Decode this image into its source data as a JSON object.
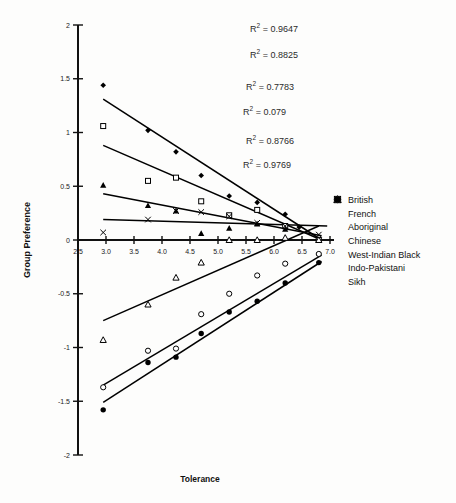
{
  "chart_data": {
    "type": "scatter",
    "title": "",
    "xlabel": "Tolerance",
    "ylabel": "Group Preference",
    "xlim": [
      2.5,
      7.0
    ],
    "ylim": [
      -2,
      2
    ],
    "grid": false,
    "xticks": [
      "2.5",
      "3.0",
      "3.5",
      "4.0",
      "4.5",
      "5.0",
      "5.5",
      "6.0",
      "6.5",
      "7.0"
    ],
    "yticks": [
      "2",
      "1.5",
      "1",
      "0.5",
      "0",
      "-0.5",
      "-1",
      "-1.5",
      "-2"
    ],
    "legend_position": "right",
    "annotations": [
      {
        "text": "R² = 0.9647",
        "value": 0.9647
      },
      {
        "text": "R² = 0.8825",
        "value": 0.8825
      },
      {
        "text": "R² = 0.7783",
        "value": 0.7783
      },
      {
        "text": "R² = 0.079",
        "value": 0.079
      },
      {
        "text": "R² = 0.8766",
        "value": 0.8766
      },
      {
        "text": "R² = 0.9769",
        "value": 0.9769
      }
    ],
    "series": [
      {
        "name": "British",
        "marker": "filled-diamond",
        "x": [
          2.95,
          3.75,
          4.25,
          4.7,
          5.2,
          5.7,
          6.2,
          6.45,
          6.8
        ],
        "y": [
          1.44,
          1.02,
          0.82,
          0.6,
          0.41,
          0.35,
          0.24,
          0.12,
          0.0
        ],
        "fit": {
          "x0": 2.95,
          "y0": 1.31,
          "x1": 6.85,
          "y1": 0.0
        }
      },
      {
        "name": "French",
        "marker": "open-square",
        "x": [
          2.95,
          3.75,
          4.25,
          4.7,
          5.2,
          5.7,
          6.2,
          6.8
        ],
        "y": [
          1.06,
          0.55,
          0.58,
          0.36,
          0.23,
          0.28,
          0.13,
          0.0
        ],
        "fit": {
          "x0": 2.95,
          "y0": 0.88,
          "x1": 6.85,
          "y1": 0.0
        }
      },
      {
        "name": "Aboriginal",
        "marker": "filled-triangle",
        "x": [
          2.95,
          3.75,
          4.25,
          4.7,
          5.2,
          5.7,
          6.2,
          6.8
        ],
        "y": [
          0.51,
          0.32,
          0.27,
          0.06,
          0.11,
          0.15,
          0.1,
          0.0
        ],
        "fit": {
          "x0": 2.95,
          "y0": 0.43,
          "x1": 6.85,
          "y1": 0.04
        }
      },
      {
        "name": "Chinese",
        "marker": "x-cross",
        "x": [
          2.95,
          3.75,
          4.25,
          4.7,
          5.2,
          5.7,
          6.2,
          6.8
        ],
        "y": [
          0.07,
          0.19,
          0.27,
          0.26,
          0.22,
          0.16,
          0.13,
          0.05
        ],
        "fit": {
          "x0": 2.95,
          "y0": 0.19,
          "x1": 6.95,
          "y1": 0.13
        }
      },
      {
        "name": "West-Indian Black",
        "marker": "open-triangle",
        "x": [
          2.95,
          3.75,
          4.25,
          4.7,
          5.2,
          5.7,
          6.2,
          6.8
        ],
        "y": [
          -0.93,
          -0.6,
          -0.35,
          -0.21,
          0.0,
          0.0,
          0.02,
          0.0
        ],
        "fit": {
          "x0": 2.95,
          "y0": -0.75,
          "x1": 6.8,
          "y1": 0.13
        }
      },
      {
        "name": "Indo-Pakistani",
        "marker": "open-circle",
        "x": [
          2.95,
          3.75,
          4.25,
          4.7,
          5.2,
          5.7,
          6.2,
          6.8
        ],
        "y": [
          -1.37,
          -1.03,
          -1.01,
          -0.69,
          -0.5,
          -0.33,
          -0.22,
          -0.13
        ],
        "fit": {
          "x0": 2.95,
          "y0": -1.35,
          "x1": 6.85,
          "y1": -0.14
        }
      },
      {
        "name": "Sikh",
        "marker": "filled-circle",
        "x": [
          2.95,
          3.75,
          4.25,
          4.7,
          5.2,
          5.7,
          6.2,
          6.8
        ],
        "y": [
          -1.58,
          -1.14,
          -1.09,
          -0.87,
          -0.67,
          -0.57,
          -0.4,
          -0.21
        ],
        "fit": {
          "x0": 2.95,
          "y0": -1.51,
          "x1": 6.85,
          "y1": -0.2
        }
      }
    ]
  },
  "legend": {
    "items": [
      {
        "label": "British",
        "marker": "filled-diamond"
      },
      {
        "label": "French",
        "marker": "open-square"
      },
      {
        "label": "Aboriginal",
        "marker": "filled-triangle"
      },
      {
        "label": "Chinese",
        "marker": "x-cross"
      },
      {
        "label": "West-Indian Black",
        "marker": "open-triangle"
      },
      {
        "label": "Indo-Pakistani",
        "marker": "open-circle"
      },
      {
        "label": "Sikh",
        "marker": "filled-circle"
      }
    ]
  }
}
